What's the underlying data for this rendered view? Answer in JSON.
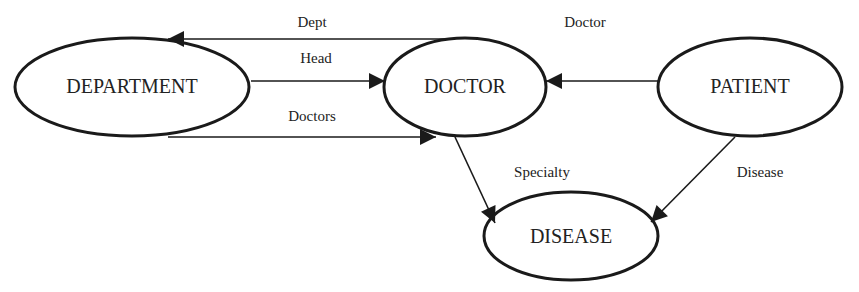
{
  "diagram": {
    "type": "entity-relationship",
    "nodes": [
      {
        "id": "department",
        "label": "DEPARTMENT",
        "cx": 132,
        "cy": 87,
        "rx": 118,
        "ry": 49
      },
      {
        "id": "doctor",
        "label": "DOCTOR",
        "cx": 465,
        "cy": 87,
        "rx": 81,
        "ry": 49
      },
      {
        "id": "patient",
        "label": "PATIENT",
        "cx": 750,
        "cy": 87,
        "rx": 92,
        "ry": 49
      },
      {
        "id": "disease",
        "label": "DISEASE",
        "cx": 571,
        "cy": 236,
        "rx": 87,
        "ry": 44
      }
    ],
    "edges": [
      {
        "id": "dept",
        "label": "Dept",
        "from": "doctor",
        "to": "department",
        "label_x": 312,
        "label_y": 27
      },
      {
        "id": "head",
        "label": "Head",
        "from": "department",
        "to": "doctor",
        "label_x": 316,
        "label_y": 63
      },
      {
        "id": "doctors",
        "label": "Doctors",
        "from": "department",
        "to": "doctor",
        "label_x": 312,
        "label_y": 121
      },
      {
        "id": "doctor",
        "label": "Doctor",
        "from": "patient",
        "to": "doctor",
        "label_x": 585,
        "label_y": 27
      },
      {
        "id": "specialty",
        "label": "Specialty",
        "from": "doctor",
        "to": "disease",
        "label_x": 542,
        "label_y": 177
      },
      {
        "id": "disease",
        "label": "Disease",
        "from": "patient",
        "to": "disease",
        "label_x": 760,
        "label_y": 177
      }
    ]
  },
  "colors": {
    "stroke": "#1a1a1a",
    "text": "#222222",
    "background": "#ffffff"
  }
}
